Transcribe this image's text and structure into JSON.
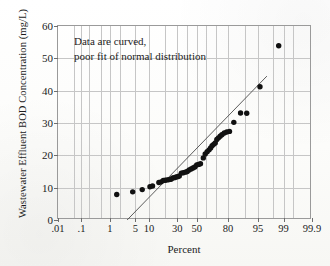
{
  "chart_data": {
    "type": "scatter",
    "title": "",
    "xlabel": "Percent",
    "ylabel": "Wastewater Effluent BOD Concentration (mg/L)",
    "annotation": {
      "line1": "Data are curved,",
      "line2": "poor fit of normal distribution"
    },
    "grid": true,
    "legend": "none",
    "x_scale": "probability",
    "xlim": [
      0.01,
      99.9
    ],
    "ylim": [
      0,
      60
    ],
    "xticks": [
      0.01,
      0.1,
      1,
      5,
      10,
      30,
      50,
      80,
      95,
      99,
      99.9
    ],
    "xtick_labels": [
      ".01",
      ".1",
      "1",
      "5",
      "10",
      "30",
      "50",
      "80",
      "95",
      "99",
      "99.9"
    ],
    "yticks": [
      0,
      10,
      20,
      30,
      40,
      50,
      60
    ],
    "ytick_labels": [
      "0",
      "10",
      "20",
      "30",
      "40",
      "50",
      "60"
    ],
    "series": [
      {
        "name": "BOD observations",
        "marker": "filled-circle",
        "color": "#111111",
        "points": [
          {
            "x": 1.6,
            "y": 7.9
          },
          {
            "x": 4.3,
            "y": 8.7
          },
          {
            "x": 7.2,
            "y": 9.4
          },
          {
            "x": 10.5,
            "y": 10.3
          },
          {
            "x": 11.8,
            "y": 10.5
          },
          {
            "x": 15.5,
            "y": 11.6
          },
          {
            "x": 17.0,
            "y": 11.8
          },
          {
            "x": 18.5,
            "y": 12.2
          },
          {
            "x": 20.0,
            "y": 12.3
          },
          {
            "x": 21.5,
            "y": 12.4
          },
          {
            "x": 23.0,
            "y": 12.5
          },
          {
            "x": 24.5,
            "y": 12.6
          },
          {
            "x": 26.0,
            "y": 13.0
          },
          {
            "x": 27.5,
            "y": 13.1
          },
          {
            "x": 29.0,
            "y": 13.3
          },
          {
            "x": 30.5,
            "y": 13.4
          },
          {
            "x": 32.0,
            "y": 13.6
          },
          {
            "x": 34.0,
            "y": 14.5
          },
          {
            "x": 36.0,
            "y": 14.6
          },
          {
            "x": 38.0,
            "y": 14.8
          },
          {
            "x": 40.0,
            "y": 15.0
          },
          {
            "x": 42.0,
            "y": 15.5
          },
          {
            "x": 44.0,
            "y": 15.8
          },
          {
            "x": 46.0,
            "y": 16.1
          },
          {
            "x": 48.0,
            "y": 16.4
          },
          {
            "x": 50.0,
            "y": 17.0
          },
          {
            "x": 52.0,
            "y": 17.2
          },
          {
            "x": 54.0,
            "y": 17.4
          },
          {
            "x": 57.0,
            "y": 19.2
          },
          {
            "x": 59.0,
            "y": 20.4
          },
          {
            "x": 61.0,
            "y": 21.1
          },
          {
            "x": 63.0,
            "y": 21.7
          },
          {
            "x": 64.5,
            "y": 22.3
          },
          {
            "x": 66.0,
            "y": 23.0
          },
          {
            "x": 67.5,
            "y": 23.4
          },
          {
            "x": 69.0,
            "y": 23.8
          },
          {
            "x": 70.5,
            "y": 24.9
          },
          {
            "x": 72.0,
            "y": 25.4
          },
          {
            "x": 73.5,
            "y": 25.9
          },
          {
            "x": 75.0,
            "y": 26.4
          },
          {
            "x": 77.0,
            "y": 26.9
          },
          {
            "x": 79.0,
            "y": 27.2
          },
          {
            "x": 81.0,
            "y": 27.4
          },
          {
            "x": 84.0,
            "y": 30.2
          },
          {
            "x": 88.0,
            "y": 33.1
          },
          {
            "x": 91.0,
            "y": 33.0
          },
          {
            "x": 95.5,
            "y": 41.2
          },
          {
            "x": 98.6,
            "y": 53.9
          }
        ]
      }
    ],
    "fit_line": {
      "name": "normal distribution fit",
      "color": "#4a4a4a",
      "x_start": 3.1,
      "y_start": 0.0,
      "x_end": 97.0,
      "y_end": 44.5
    }
  }
}
